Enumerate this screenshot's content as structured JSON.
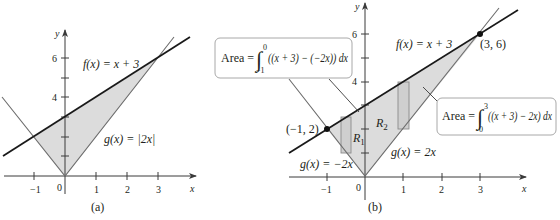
{
  "colors": {
    "ink": "#231f20",
    "axis": "#3a3a3a",
    "f_line": "#1a1a1a",
    "g_line": "#6d6d6d",
    "shade": "#dcdcdc",
    "callout_border": "#a8a8a8",
    "rect_fill": "#cfcfcf",
    "rect_stroke": "#8a8a8a"
  },
  "panel_a": {
    "caption": "(a)",
    "axis_x_label": "x",
    "axis_y_label": "y",
    "x_ticks": [
      {
        "value": -1,
        "label": "−1"
      },
      {
        "value": 1,
        "label": "1"
      },
      {
        "value": 2,
        "label": "2"
      },
      {
        "value": 3,
        "label": "3"
      }
    ],
    "y_ticks": [
      {
        "value": 1,
        "label": ""
      },
      {
        "value": 2,
        "label": ""
      },
      {
        "value": 3,
        "label": ""
      },
      {
        "value": 4,
        "label": "4"
      },
      {
        "value": 5,
        "label": ""
      },
      {
        "value": 6,
        "label": "6"
      }
    ],
    "origin_label": "0",
    "f_label_name": "f",
    "f_label_rest": "(x) = x + 3",
    "g_label_name": "g",
    "g_label_rest": "(x) = |2x|"
  },
  "panel_b": {
    "caption": "(b)",
    "axis_x_label": "x",
    "axis_y_label": "y",
    "x_ticks": [
      {
        "value": -1,
        "label": "−1"
      },
      {
        "value": 1,
        "label": "1"
      },
      {
        "value": 2,
        "label": "2"
      },
      {
        "value": 3,
        "label": "3"
      }
    ],
    "y_ticks": [
      {
        "value": 1,
        "label": ""
      },
      {
        "value": 2,
        "label": ""
      },
      {
        "value": 3,
        "label": ""
      },
      {
        "value": 4,
        "label": "4"
      },
      {
        "value": 5,
        "label": ""
      },
      {
        "value": 6,
        "label": "6"
      }
    ],
    "origin_label": "0",
    "f_label_name": "f",
    "f_label_rest": "(x) = x + 3",
    "g_right_label": "g(x) = 2x",
    "g_left_label": "g(x) = −2x",
    "point_left": "(−1, 2)",
    "point_right": "(3, 6)",
    "region_1": {
      "letter": "R",
      "subscript": "1"
    },
    "region_2": {
      "letter": "R",
      "subscript": "2"
    },
    "callout_left": {
      "prefix": "Area = ",
      "upper_limit": "0",
      "lower_limit": "−1",
      "integrand": "((x + 3) − (−2x)) dx"
    },
    "callout_right": {
      "prefix": "Area = ",
      "upper_limit": "3",
      "lower_limit": "0",
      "integrand": "((x + 3) − 2x) dx"
    }
  }
}
